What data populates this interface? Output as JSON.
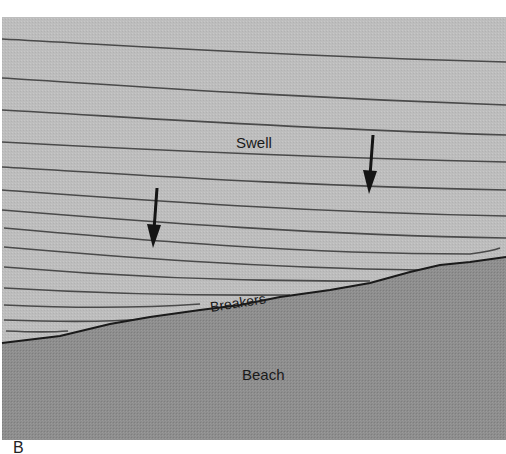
{
  "figure": {
    "panel_letter": "B",
    "labels": {
      "swell": "Swell",
      "breakers": "Breakers",
      "beach": "Beach"
    },
    "colors": {
      "water": "#bdbdbd",
      "beach": "#8c8c8c",
      "wave_line": "#4a4a4a",
      "shoreline": "#1a1a1a",
      "arrow": "#151515",
      "background": "#ffffff"
    },
    "arrows": [
      {
        "name": "wave-direction-arrow-left",
        "x1": 157,
        "y1": 188,
        "x2": 153,
        "y2": 247
      },
      {
        "name": "wave-direction-arrow-right",
        "x1": 373,
        "y1": 135,
        "x2": 369,
        "y2": 193
      }
    ]
  }
}
